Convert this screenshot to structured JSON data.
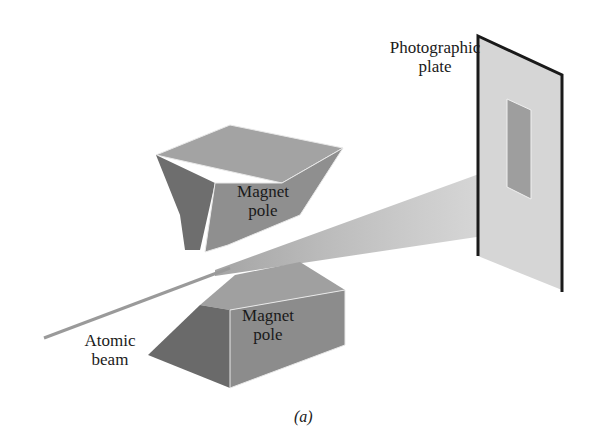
{
  "diagram": {
    "labels": {
      "photographic_plate_line1": "Photographic",
      "photographic_plate_line2": "plate",
      "upper_pole_line1": "Magnet",
      "upper_pole_line2": "pole",
      "lower_pole_line1": "Magnet",
      "lower_pole_line2": "pole",
      "beam_line1": "Atomic",
      "beam_line2": "beam",
      "caption": "(a)"
    },
    "colors": {
      "background": "#ffffff",
      "pole_dark": "#6e6e6e",
      "pole_mid": "#8f8f8f",
      "pole_light": "#a9a9a9",
      "beam": "#9a9a9a",
      "plate": "#d6d6d6",
      "plate_edge": "#1a1a1a",
      "trace": "#9e9e9e"
    }
  }
}
